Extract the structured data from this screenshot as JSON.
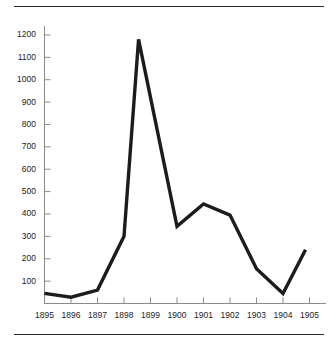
{
  "chart_data": {
    "type": "line",
    "title": "",
    "subtitle": "",
    "xlabel": "",
    "ylabel": "",
    "x": [
      1895,
      1896,
      1897,
      1898,
      1899,
      1900,
      1901,
      1902,
      1903,
      1904,
      1905
    ],
    "categories": [
      "1895",
      "1896",
      "1897",
      "1898",
      "1899",
      "1900",
      "1901",
      "1902",
      "1903",
      "1904",
      "1905"
    ],
    "values": [
      45,
      28,
      60,
      300,
      1180,
      345,
      445,
      395,
      155,
      45,
      240
    ],
    "series": [
      {
        "name": "",
        "values": [
          45,
          28,
          60,
          300,
          1180,
          345,
          445,
          395,
          155,
          45,
          240
        ]
      }
    ],
    "xlim": [
      1895,
      1905
    ],
    "ylim": [
      0,
      1240
    ],
    "ytick_labels": [
      "1200",
      "1100",
      "1000",
      "900",
      "800",
      "700",
      "600",
      "500",
      "400",
      "300",
      "200",
      "100"
    ],
    "ytick_values": [
      1200,
      1100,
      1000,
      900,
      800,
      700,
      600,
      500,
      400,
      300,
      200,
      100
    ],
    "xtick_labels": [
      "1895",
      "1896",
      "1897",
      "1898",
      "1899",
      "1900",
      "1901",
      "1902",
      "1903",
      "1904",
      "1905"
    ],
    "grid": false,
    "legend": false,
    "legend_position": "none",
    "line_color": "#1c1c1c",
    "axis_color": "#8a8a8a",
    "background_color": "#ffffff",
    "annotations": [],
    "notes": {
      "peak_year": "1899",
      "peak_value": "1180",
      "line_offsets": {
        "first_point_offset_years": 0.0,
        "peak_offset_years": -0.45,
        "last_point_offset_years": -0.15
      }
    }
  },
  "decorations": {
    "top_rule": "horizontal-rule",
    "bottom_rule": "horizontal-rule"
  }
}
